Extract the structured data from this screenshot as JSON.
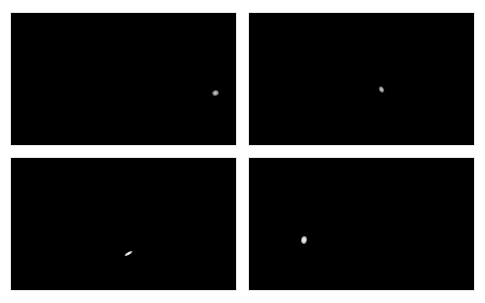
{
  "layout": {
    "rows": 2,
    "cols": 2,
    "background": "#ffffff",
    "panel_background": "#000000"
  },
  "panels": [
    {
      "position": "top-left",
      "left": 11,
      "top": 13,
      "object": {
        "x": 201,
        "y": 77,
        "w": 7,
        "h": 6,
        "rotate": -15,
        "brightness": "dim"
      }
    },
    {
      "position": "top-right",
      "left": 249,
      "top": 13,
      "object": {
        "x": 130,
        "y": 73,
        "w": 5,
        "h": 7,
        "rotate": -30,
        "brightness": "dim"
      }
    },
    {
      "position": "bottom-left",
      "left": 11,
      "top": 158,
      "object": {
        "x": 113,
        "y": 94,
        "w": 9,
        "h": 3,
        "rotate": -30,
        "brightness": "bright"
      }
    },
    {
      "position": "bottom-right",
      "left": 249,
      "top": 158,
      "object": {
        "x": 52,
        "y": 78,
        "w": 6,
        "h": 8,
        "rotate": 10,
        "brightness": "bright"
      }
    }
  ]
}
